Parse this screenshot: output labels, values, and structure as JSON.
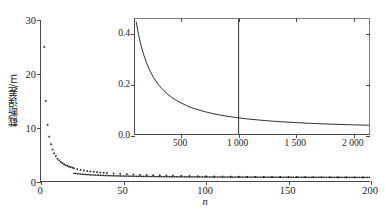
{
  "chart_data": [
    {
      "id": "main",
      "type": "scatter",
      "title": "",
      "xlabel": "n",
      "ylabel": "截断误差/m",
      "xlim": [
        0,
        200
      ],
      "ylim": [
        0,
        30
      ],
      "grid": false,
      "legend": null,
      "xticks": [
        0,
        50,
        100,
        150,
        200
      ],
      "xticklabels": [
        "0",
        "50",
        "100",
        "150",
        "200"
      ],
      "yticks": [
        0,
        10,
        20,
        30
      ],
      "yticklabels": [
        "0",
        "10",
        "20",
        "30"
      ],
      "marker": "dot",
      "marker_color": "#1a1a1a",
      "x": [
        2,
        3,
        4,
        5,
        6,
        7,
        8,
        9,
        10,
        11,
        12,
        13,
        14,
        15,
        16,
        17,
        18,
        19,
        20,
        22,
        24,
        26,
        28,
        30,
        32,
        34,
        36,
        38,
        40,
        44,
        48,
        52,
        56,
        60,
        64,
        68,
        72,
        76,
        80,
        85,
        90,
        95,
        100,
        105,
        110,
        115,
        120,
        125,
        130,
        135,
        140,
        145,
        150,
        155,
        160,
        165,
        170,
        175,
        180,
        185,
        190,
        195,
        200
      ],
      "y": [
        25.0,
        15.0,
        10.6,
        8.4,
        7.0,
        6.0,
        5.3,
        4.8,
        4.3,
        4.0,
        3.7,
        3.5,
        3.3,
        3.1,
        3.0,
        2.85,
        2.75,
        2.65,
        2.55,
        2.38,
        2.25,
        2.13,
        2.03,
        1.95,
        1.87,
        1.81,
        1.75,
        1.7,
        1.65,
        1.57,
        1.5,
        1.44,
        1.39,
        1.34,
        1.3,
        1.26,
        1.23,
        1.2,
        1.17,
        1.14,
        1.11,
        1.08,
        1.06,
        1.04,
        1.02,
        1.0,
        0.99,
        0.97,
        0.96,
        0.95,
        0.94,
        0.93,
        0.92,
        0.91,
        0.9,
        0.89,
        0.88,
        0.875,
        0.87,
        0.865,
        0.86,
        0.855,
        0.85
      ]
    },
    {
      "id": "inset",
      "type": "line",
      "title": "",
      "xlabel": "",
      "ylabel": "",
      "xlim": [
        100,
        2150
      ],
      "ylim": [
        0,
        0.46
      ],
      "grid": false,
      "legend": null,
      "xticks": [
        500,
        1000,
        1500,
        2000
      ],
      "xticklabels": [
        "500",
        "1 000",
        "1 500",
        "2 000"
      ],
      "yticks": [
        0.0,
        0.2,
        0.4
      ],
      "yticklabels": [
        "0.0",
        "0.2",
        "0.4"
      ],
      "line_color": "#1a1a1a",
      "x": [
        110,
        130,
        150,
        175,
        200,
        230,
        260,
        300,
        340,
        380,
        420,
        460,
        500,
        550,
        600,
        650,
        700,
        760,
        820,
        880,
        940,
        1000,
        1080,
        1160,
        1240,
        1320,
        1400,
        1500,
        1600,
        1700,
        1800,
        1900,
        2000,
        2100,
        2150
      ],
      "y": [
        0.45,
        0.4,
        0.36,
        0.32,
        0.288,
        0.256,
        0.231,
        0.204,
        0.183,
        0.166,
        0.152,
        0.14,
        0.13,
        0.119,
        0.11,
        0.103,
        0.0965,
        0.0897,
        0.084,
        0.0792,
        0.075,
        0.0712,
        0.067,
        0.0634,
        0.0603,
        0.0576,
        0.0552,
        0.0526,
        0.0503,
        0.0484,
        0.0467,
        0.0452,
        0.0438,
        0.0426,
        0.042
      ],
      "annotations": [
        {
          "type": "vline",
          "name": "reference-line-1000",
          "x": 1000,
          "color": "#1a1a1a"
        }
      ]
    }
  ],
  "main": {
    "xlabel": "n",
    "ylabel": "截断误差/m",
    "xticklabels": [
      "0",
      "50",
      "100",
      "150",
      "200"
    ],
    "yticklabels": [
      "0",
      "10",
      "20",
      "30"
    ]
  },
  "inset": {
    "xticklabels": [
      "500",
      "1 000",
      "1 500",
      "2 000"
    ],
    "yticklabels": [
      "0.0",
      "0.2",
      "0.4"
    ]
  }
}
